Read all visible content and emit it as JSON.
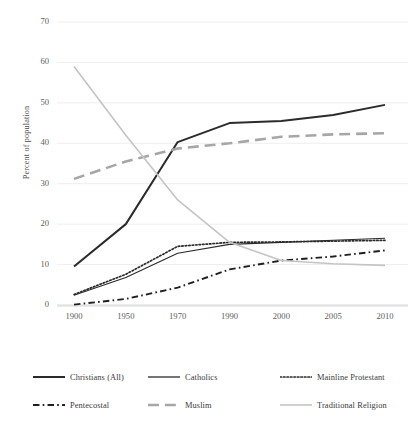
{
  "chart_data": {
    "type": "line",
    "title": "",
    "subtitle": "",
    "xlabel": "",
    "ylabel": "Percent of population",
    "categories": [
      "1900",
      "1950",
      "1970",
      "1990",
      "2000",
      "2005",
      "2010"
    ],
    "ylim": [
      0,
      70
    ],
    "ytick_values": [
      0,
      10,
      20,
      30,
      40,
      50,
      60,
      70
    ],
    "ytick_labels": [
      "0",
      "10",
      "20",
      "30",
      "40",
      "50",
      "60",
      "70"
    ],
    "grid": true,
    "grid_axis": "y",
    "legend_position": "bottom",
    "legend_columns": 3,
    "series": [
      {
        "name": "Christians (All)",
        "values": [
          9.5,
          20.0,
          40.3,
          45.0,
          45.5,
          47.0,
          49.5
        ],
        "color": "#2b2b2b",
        "style": "solid",
        "width": 2.0
      },
      {
        "name": "Catholics",
        "values": [
          2.4,
          6.8,
          12.8,
          15.0,
          15.5,
          16.0,
          16.5
        ],
        "color": "#2b2b2b",
        "style": "solid",
        "width": 1.1
      },
      {
        "name": "Mainline Protestant",
        "values": [
          2.6,
          7.6,
          14.5,
          15.5,
          15.6,
          15.8,
          16.0
        ],
        "color": "#2b2b2b",
        "style": "dotted",
        "width": 1.7
      },
      {
        "name": "Pentecostal",
        "values": [
          0.1,
          1.5,
          4.3,
          8.8,
          11.0,
          12.0,
          13.5
        ],
        "color": "#1f1f1f",
        "style": "dashdot",
        "width": 1.9
      },
      {
        "name": "Muslim",
        "values": [
          31.2,
          35.5,
          38.7,
          40.0,
          41.6,
          42.2,
          42.5
        ],
        "color": "#a6a6a6",
        "style": "dashed",
        "width": 2.6
      },
      {
        "name": "Traditional Religion",
        "values": [
          59.0,
          42.0,
          26.0,
          15.5,
          11.0,
          10.2,
          9.8
        ],
        "color": "#c4c4c4",
        "style": "solid",
        "width": 1.6
      }
    ]
  },
  "legend": {
    "items": [
      {
        "label": "Christians (All)",
        "swatch": "solid-thick-dark"
      },
      {
        "label": "Catholics",
        "swatch": "solid-thin-dark"
      },
      {
        "label": "Mainline Protestant",
        "swatch": "dotted-dark"
      },
      {
        "label": "Pentecostal",
        "swatch": "dashdot-dark"
      },
      {
        "label": "Muslim",
        "swatch": "dashed-gray"
      },
      {
        "label": "Traditional Religion",
        "swatch": "solid-lightgray"
      }
    ]
  },
  "axis": {
    "y_title": "Percent of population"
  },
  "colors": {
    "background": "#ffffff",
    "grid": "#ececec",
    "axis_line": "#d8d8d8",
    "tick_text": "#5c5c5c",
    "dark_series": "#2b2b2b",
    "muslim_gray": "#a6a6a6",
    "traditional_gray": "#c4c4c4"
  }
}
